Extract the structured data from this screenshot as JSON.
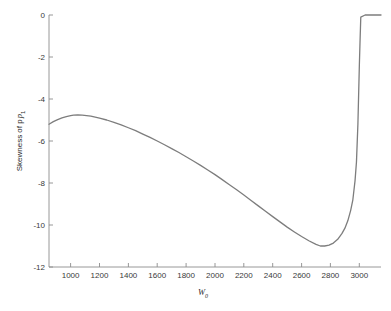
{
  "figure": {
    "background_color": "#ffffff",
    "axis_color": "#8c8c8c",
    "line_color": "#7d7d7d",
    "text_color": "#2b2b2b"
  },
  "axes": {
    "xlabel_main": "W",
    "xlabel_sub": "0",
    "ylabel_main": "Skewness of p",
    "ylabel_sub": "1",
    "x_ticks": [
      "1000",
      "1200",
      "1400",
      "1600",
      "1800",
      "2000",
      "2200",
      "2400",
      "2600",
      "2800",
      "3000"
    ],
    "y_ticks": [
      "0",
      "-2",
      "-4",
      "-6",
      "-8",
      "-10",
      "-12"
    ]
  },
  "chart_data": {
    "type": "line",
    "title": "",
    "xlabel": "W_0",
    "ylabel": "Skewness of p_1",
    "xlim": [
      850,
      3150
    ],
    "ylim": [
      -12,
      0
    ],
    "grid": false,
    "legend": null,
    "x_tick_values": [
      1000,
      1200,
      1400,
      1600,
      1800,
      2000,
      2200,
      2400,
      2600,
      2800,
      3000
    ],
    "y_tick_values": [
      0,
      -2,
      -4,
      -6,
      -8,
      -10,
      -12
    ],
    "series": [
      {
        "name": "Skewness of p_1",
        "color": "#7d7d7d",
        "x": [
          850,
          880,
          910,
          940,
          970,
          1000,
          1020,
          1050,
          1080,
          1110,
          1140,
          1170,
          1200,
          1250,
          1300,
          1350,
          1400,
          1450,
          1500,
          1550,
          1600,
          1650,
          1700,
          1750,
          1800,
          1850,
          1900,
          1950,
          2000,
          2050,
          2100,
          2150,
          2200,
          2250,
          2300,
          2350,
          2400,
          2450,
          2500,
          2550,
          2600,
          2650,
          2700,
          2730,
          2760,
          2790,
          2820,
          2850,
          2880,
          2900,
          2920,
          2940,
          2955,
          2970,
          2980,
          2990,
          3000,
          3005,
          3010,
          3040,
          3080,
          3120,
          3150
        ],
        "y": [
          -5.2,
          -5.08,
          -4.98,
          -4.9,
          -4.84,
          -4.79,
          -4.77,
          -4.76,
          -4.77,
          -4.79,
          -4.82,
          -4.86,
          -4.91,
          -5.0,
          -5.11,
          -5.23,
          -5.37,
          -5.51,
          -5.67,
          -5.83,
          -6.0,
          -6.18,
          -6.36,
          -6.55,
          -6.75,
          -6.95,
          -7.16,
          -7.38,
          -7.6,
          -7.84,
          -8.08,
          -8.32,
          -8.57,
          -8.83,
          -9.09,
          -9.35,
          -9.6,
          -9.85,
          -10.1,
          -10.33,
          -10.55,
          -10.75,
          -10.92,
          -11.0,
          -11.0,
          -10.96,
          -10.86,
          -10.68,
          -10.4,
          -10.15,
          -9.8,
          -9.3,
          -8.8,
          -7.9,
          -7.0,
          -5.2,
          -2.4,
          -1.2,
          -0.1,
          0.0,
          0.0,
          0.0,
          0.0
        ]
      }
    ],
    "annotations": [
      {
        "text": "local maximum near W0 = 1020, value about -4.77"
      },
      {
        "text": "global minimum near W0 = 2720, value about -11.0"
      },
      {
        "text": "curve jumps to 0 near W0 = 3010 and stays flat at 0"
      }
    ]
  }
}
